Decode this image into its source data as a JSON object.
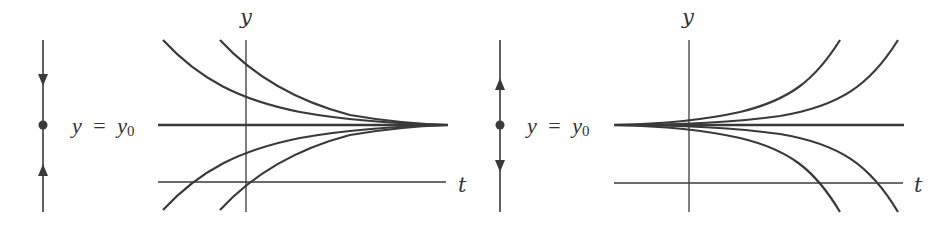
{
  "colors": {
    "stroke": "#3a3a3a",
    "background": "#ffffff"
  },
  "panels": [
    {
      "name": "sink",
      "phase_line": {
        "arrows": [
          "down",
          "up"
        ],
        "equilibrium_dot": true
      },
      "equilibrium_label": {
        "var": "y",
        "equals": "=",
        "rhs": "y",
        "sub": "0"
      },
      "axes": {
        "x_label": "t",
        "y_label": "y"
      },
      "behavior": "solutions converge to y = y0 as t increases"
    },
    {
      "name": "source",
      "phase_line": {
        "arrows": [
          "up",
          "down"
        ],
        "equilibrium_dot": true
      },
      "equilibrium_label": {
        "var": "y",
        "equals": "=",
        "rhs": "y",
        "sub": "0"
      },
      "axes": {
        "x_label": "t",
        "y_label": "y"
      },
      "behavior": "solutions diverge from y = y0 as t increases"
    }
  ]
}
